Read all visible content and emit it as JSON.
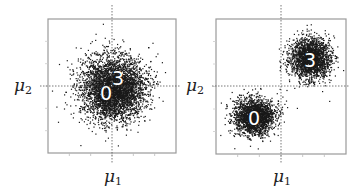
{
  "figure": {
    "panels": [
      {
        "id": "left",
        "xlabel_symbol": "μ",
        "xlabel_sub": "1",
        "ylabel_symbol": "μ",
        "ylabel_sub": "2",
        "clusters": [
          {
            "label": "0",
            "cx": 112,
            "cy": 88,
            "sx": 16,
            "sy": 16,
            "n": 2600
          },
          {
            "label": "3",
            "cx": 114,
            "cy": 88,
            "sx": 15,
            "sy": 15,
            "n": 1600
          }
        ],
        "label_positions": [
          {
            "text": "0",
            "x": 106,
            "y": 100,
            "size": 19
          },
          {
            "text": "3",
            "x": 118,
            "y": 85,
            "size": 19
          }
        ]
      },
      {
        "id": "right",
        "xlabel_symbol": "μ",
        "xlabel_sub": "1",
        "ylabel_symbol": "μ",
        "ylabel_sub": "2",
        "clusters": [
          {
            "label": "3",
            "cx": 310,
            "cy": 58,
            "sx": 10,
            "sy": 10,
            "n": 2200
          },
          {
            "label": "0",
            "cx": 254,
            "cy": 116,
            "sx": 10,
            "sy": 9,
            "n": 2200
          }
        ],
        "label_positions": [
          {
            "text": "3",
            "x": 310,
            "y": 67,
            "size": 19
          },
          {
            "text": "0",
            "x": 254,
            "y": 125,
            "size": 19
          }
        ]
      }
    ],
    "colors": {
      "points": "#1a1a1a",
      "frame": "#9a9a9a",
      "crosshair": "#555555",
      "label_text": "#ffffff"
    }
  }
}
